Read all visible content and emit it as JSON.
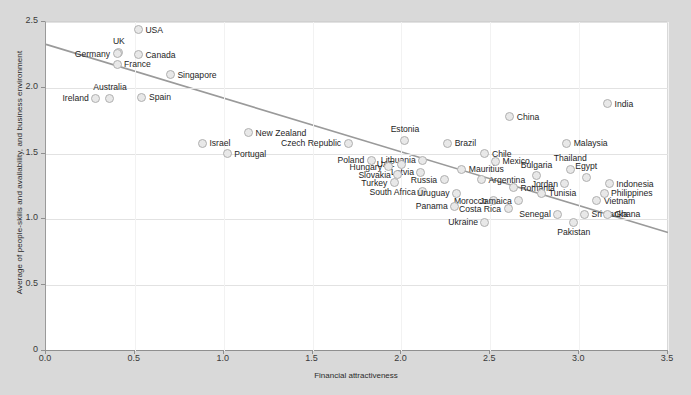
{
  "chart_data": {
    "type": "scatter",
    "title": "",
    "xlabel": "Financial attractiveness",
    "ylabel": "Average of people-skills and availability, and business environment",
    "xlim": [
      0.0,
      3.5
    ],
    "ylim": [
      0.0,
      2.5
    ],
    "xticks": [
      "0.0",
      "0.5",
      "1.0",
      "1.5",
      "2.0",
      "2.5",
      "3.0",
      "3.5"
    ],
    "yticks": [
      "0",
      "0.5",
      "1.0",
      "1.5",
      "2.0",
      "2.5"
    ],
    "grid": true,
    "legend": "none",
    "marker_fill": "#e8e8e8",
    "marker_stroke": "#b0b0b0",
    "trendline": {
      "type": "linear",
      "x0": 0.0,
      "y0": 2.33,
      "x1": 3.5,
      "y1": 0.9,
      "color": "#9a9a9a"
    },
    "points": [
      {
        "label": "USA",
        "x": 0.52,
        "y": 2.44,
        "lpos": "right"
      },
      {
        "label": "UK",
        "x": 0.41,
        "y": 2.27,
        "lpos": "top"
      },
      {
        "label": "Germany",
        "x": 0.4,
        "y": 2.26,
        "lpos": "left"
      },
      {
        "label": "Canada",
        "x": 0.52,
        "y": 2.25,
        "lpos": "right"
      },
      {
        "label": "France",
        "x": 0.4,
        "y": 2.18,
        "lpos": "right"
      },
      {
        "label": "Singapore",
        "x": 0.7,
        "y": 2.1,
        "lpos": "right"
      },
      {
        "label": "Australia",
        "x": 0.36,
        "y": 1.92,
        "lpos": "top"
      },
      {
        "label": "Ireland",
        "x": 0.28,
        "y": 1.92,
        "lpos": "left"
      },
      {
        "label": "Spain",
        "x": 0.54,
        "y": 1.93,
        "lpos": "right"
      },
      {
        "label": "New Zealand",
        "x": 1.14,
        "y": 1.66,
        "lpos": "right"
      },
      {
        "label": "Israel",
        "x": 0.88,
        "y": 1.58,
        "lpos": "right"
      },
      {
        "label": "Portugal",
        "x": 1.02,
        "y": 1.5,
        "lpos": "right"
      },
      {
        "label": "Czech Republic",
        "x": 1.7,
        "y": 1.58,
        "lpos": "left"
      },
      {
        "label": "Estonia",
        "x": 2.02,
        "y": 1.6,
        "lpos": "top"
      },
      {
        "label": "Brazil",
        "x": 2.26,
        "y": 1.58,
        "lpos": "right"
      },
      {
        "label": "China",
        "x": 2.61,
        "y": 1.78,
        "lpos": "right"
      },
      {
        "label": "India",
        "x": 3.16,
        "y": 1.88,
        "lpos": "right"
      },
      {
        "label": "Malaysia",
        "x": 2.93,
        "y": 1.58,
        "lpos": "right"
      },
      {
        "label": "Chile",
        "x": 2.47,
        "y": 1.5,
        "lpos": "right"
      },
      {
        "label": "Mexico",
        "x": 2.53,
        "y": 1.44,
        "lpos": "right"
      },
      {
        "label": "Poland",
        "x": 1.83,
        "y": 1.45,
        "lpos": "left"
      },
      {
        "label": "Lithuania",
        "x": 2.12,
        "y": 1.45,
        "lpos": "left"
      },
      {
        "label": "UAE",
        "x": 2.0,
        "y": 1.42,
        "lpos": "left"
      },
      {
        "label": "Hungary",
        "x": 1.93,
        "y": 1.4,
        "lpos": "left"
      },
      {
        "label": "Mauritius",
        "x": 2.34,
        "y": 1.38,
        "lpos": "right"
      },
      {
        "label": "Latvia",
        "x": 2.11,
        "y": 1.36,
        "lpos": "left"
      },
      {
        "label": "Slovakia",
        "x": 1.98,
        "y": 1.34,
        "lpos": "left"
      },
      {
        "label": "Russia",
        "x": 2.24,
        "y": 1.3,
        "lpos": "left"
      },
      {
        "label": "Argentina",
        "x": 2.45,
        "y": 1.3,
        "lpos": "right"
      },
      {
        "label": "Turkey",
        "x": 1.96,
        "y": 1.28,
        "lpos": "left"
      },
      {
        "label": "Bulgaria",
        "x": 2.76,
        "y": 1.33,
        "lpos": "top"
      },
      {
        "label": "Thailand",
        "x": 2.95,
        "y": 1.38,
        "lpos": "top"
      },
      {
        "label": "Egypt",
        "x": 3.04,
        "y": 1.32,
        "lpos": "top"
      },
      {
        "label": "Jordan",
        "x": 2.92,
        "y": 1.27,
        "lpos": "left"
      },
      {
        "label": "Indonesia",
        "x": 3.17,
        "y": 1.27,
        "lpos": "right"
      },
      {
        "label": "Romania",
        "x": 2.63,
        "y": 1.24,
        "lpos": "right"
      },
      {
        "label": "Philippines",
        "x": 3.14,
        "y": 1.2,
        "lpos": "right"
      },
      {
        "label": "South Africa",
        "x": 2.12,
        "y": 1.21,
        "lpos": "left"
      },
      {
        "label": "Uruguay",
        "x": 2.31,
        "y": 1.2,
        "lpos": "left"
      },
      {
        "label": "Tunisia",
        "x": 2.79,
        "y": 1.2,
        "lpos": "right"
      },
      {
        "label": "Vietnam",
        "x": 3.1,
        "y": 1.14,
        "lpos": "right"
      },
      {
        "label": "Morocco",
        "x": 2.52,
        "y": 1.14,
        "lpos": "left"
      },
      {
        "label": "Jamaica",
        "x": 2.66,
        "y": 1.14,
        "lpos": "left"
      },
      {
        "label": "Panama",
        "x": 2.3,
        "y": 1.1,
        "lpos": "left"
      },
      {
        "label": "Costa Rica",
        "x": 2.6,
        "y": 1.08,
        "lpos": "left"
      },
      {
        "label": "Senegal",
        "x": 2.88,
        "y": 1.04,
        "lpos": "left"
      },
      {
        "label": "Sri Lanka",
        "x": 3.03,
        "y": 1.04,
        "lpos": "right"
      },
      {
        "label": "Ghana",
        "x": 3.16,
        "y": 1.04,
        "lpos": "right"
      },
      {
        "label": "Ukraine",
        "x": 2.47,
        "y": 0.98,
        "lpos": "left"
      },
      {
        "label": "Pakistan",
        "x": 2.97,
        "y": 0.98,
        "lpos": "bottom"
      }
    ]
  }
}
